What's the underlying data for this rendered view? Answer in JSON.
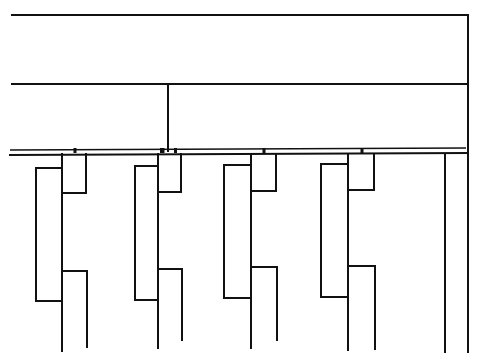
{
  "diagram": {
    "type": "line-drawing",
    "stroke_color": "#111111",
    "background": "#ffffff",
    "frame": {
      "top_line": {
        "x1": 12,
        "y1": 15,
        "x2": 468,
        "y2": 15
      },
      "middle_line": {
        "x1": 12,
        "y1": 84,
        "x2": 468,
        "y2": 84
      },
      "right_edge": {
        "x1": 468,
        "y1": 15,
        "x2": 468,
        "y2": 352
      },
      "center_post": {
        "x1": 168,
        "y1": 84,
        "x2": 168,
        "y2": 151
      }
    },
    "rail": {
      "upper": {
        "x1": 10,
        "y1": 150,
        "x2": 466,
        "y2": 148
      },
      "lower": {
        "x1": 10,
        "y1": 155,
        "x2": 468,
        "y2": 153
      }
    },
    "units": [
      {
        "label": "unit-1",
        "spine_x": 62,
        "bracket_left_x": 36,
        "bracket_top_y": 168,
        "bracket_bottom_y": 301,
        "upper_box_right_x": 86,
        "upper_box_bottom_y": 193,
        "lower_box_top_y": 271,
        "lower_box_right_x": 87,
        "spine_bottom_y": 351,
        "lower_arm_bottom_y": 347,
        "tab_x": 75
      },
      {
        "label": "unit-2",
        "spine_x": 158,
        "bracket_left_x": 135,
        "bracket_top_y": 166,
        "bracket_bottom_y": 300,
        "upper_box_right_x": 181,
        "upper_box_bottom_y": 192,
        "lower_box_top_y": 269,
        "lower_box_right_x": 182,
        "spine_bottom_y": 348,
        "lower_arm_bottom_y": 340,
        "tab_x": 163
      },
      {
        "label": "unit-3",
        "spine_x": 251,
        "bracket_left_x": 224,
        "bracket_top_y": 165,
        "bracket_bottom_y": 298,
        "upper_box_right_x": 276,
        "upper_box_bottom_y": 191,
        "lower_box_top_y": 267,
        "lower_box_right_x": 277,
        "spine_bottom_y": 348,
        "lower_arm_bottom_y": 340,
        "tab_x": 264
      },
      {
        "label": "unit-4",
        "spine_x": 348,
        "bracket_left_x": 321,
        "bracket_top_y": 164,
        "bracket_bottom_y": 297,
        "upper_box_right_x": 374,
        "upper_box_bottom_y": 190,
        "lower_box_top_y": 266,
        "lower_box_right_x": 375,
        "spine_bottom_y": 350,
        "lower_arm_bottom_y": 349,
        "tab_x": 362
      }
    ],
    "end_post": {
      "x": 445,
      "y1": 154,
      "y2": 352
    }
  }
}
